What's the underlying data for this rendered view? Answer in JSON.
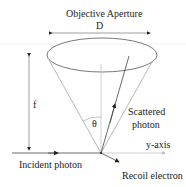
{
  "diagram": {
    "title": "Objective Aperture",
    "aperture_label": "D",
    "focal_label": "f",
    "angle_label": "θ",
    "scattered_label_line1": "Scattered",
    "scattered_label_line2": "photon",
    "axis_label": "y-axis",
    "incident_label": "Incident photon",
    "recoil_label": "Recoil electron"
  },
  "colors": {
    "line": "#555555",
    "light": "#aaaaaa",
    "text": "#222222"
  }
}
